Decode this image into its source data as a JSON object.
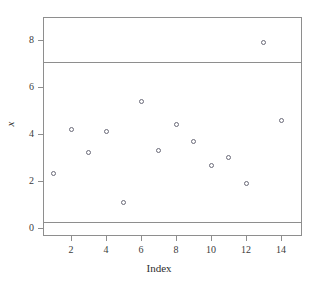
{
  "chart_data": {
    "type": "scatter",
    "title": "",
    "xlabel": "Index",
    "ylabel": "x",
    "xlim": [
      0.4,
      15.2
    ],
    "ylim": [
      -0.35,
      9.0
    ],
    "grid": false,
    "legend": "none",
    "x": [
      1,
      2,
      3,
      4,
      5,
      6,
      7,
      8,
      9,
      10,
      11,
      12,
      13,
      14
    ],
    "values": [
      2.3,
      4.2,
      3.2,
      4.1,
      1.1,
      5.4,
      3.3,
      4.4,
      3.7,
      2.65,
      3.0,
      1.9,
      7.9,
      4.6
    ],
    "xticks": [
      2,
      4,
      6,
      8,
      10,
      12,
      14
    ],
    "xtick_labels": [
      "2",
      "4",
      "6",
      "8",
      "10",
      "12",
      "14"
    ],
    "yticks": [
      0,
      2,
      4,
      6,
      8
    ],
    "ytick_labels": [
      "0",
      "2",
      "4",
      "6",
      "8"
    ],
    "annotations": [
      {
        "name": "upper-control-limit",
        "type": "hline",
        "y": 7.1
      },
      {
        "name": "lower-control-limit",
        "type": "hline",
        "y": 0.25
      }
    ],
    "marker": "open-circle",
    "marker_color": "#6a6a78",
    "line_color": "#8e8e8e",
    "axis_color": "#8e8e8e"
  }
}
